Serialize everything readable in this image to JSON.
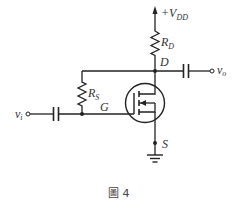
{
  "figure": {
    "caption": "圖 4",
    "type": "common-source MOSFET amplifier with drain-feedback resistor"
  },
  "labels": {
    "supply": {
      "prefix": "+V",
      "sub": "DD"
    },
    "drain_resistor": {
      "main": "R",
      "sub": "D"
    },
    "feedback_resistor": {
      "main": "R",
      "sub": "S"
    },
    "drain": "D",
    "gate": "G",
    "source": "S",
    "input": {
      "main": "v",
      "sub": "i"
    },
    "output": {
      "main": "v",
      "sub": "o"
    }
  },
  "components": [
    {
      "id": "vdd-supply",
      "kind": "supply-arrow"
    },
    {
      "id": "rd",
      "kind": "resistor",
      "label": "R_D"
    },
    {
      "id": "rs",
      "kind": "resistor",
      "label": "R_S"
    },
    {
      "id": "cin",
      "kind": "capacitor"
    },
    {
      "id": "cout",
      "kind": "capacitor"
    },
    {
      "id": "m1",
      "kind": "n-channel enhancement MOSFET"
    },
    {
      "id": "gnd",
      "kind": "ground"
    }
  ],
  "colors": {
    "stroke": "#222222",
    "text": "#333333",
    "background": "#ffffff"
  }
}
